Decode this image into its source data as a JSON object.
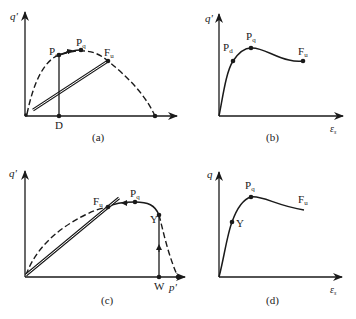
{
  "colors": {
    "ink": "#1a1a1a",
    "background": "#ffffff"
  },
  "panels": [
    {
      "id": "a",
      "caption": "(a)",
      "y_axis_label": "q'",
      "x_axis_label": "",
      "points": {
        "Pd": "P",
        "Pd_sub": "d",
        "Pq": "P",
        "Pq_sub": "q",
        "Fu": "F",
        "Fu_sub": "u",
        "D": "D"
      }
    },
    {
      "id": "b",
      "caption": "(b)",
      "y_axis_label": "q'",
      "x_axis_label": "ε",
      "x_axis_sub": "s",
      "points": {
        "Pd": "P",
        "Pd_sub": "d",
        "Pq": "P",
        "Pq_sub": "q",
        "Fu": "F",
        "Fu_sub": "u"
      }
    },
    {
      "id": "c",
      "caption": "(c)",
      "y_axis_label": "q'",
      "x_axis_label": "p'",
      "points": {
        "Fu": "F",
        "Fu_sub": "u",
        "Pq": "P",
        "Pq_sub": "q",
        "Y": "Y",
        "W": "W"
      }
    },
    {
      "id": "d",
      "caption": "(d)",
      "y_axis_label": "q",
      "x_axis_label": "ε",
      "x_axis_sub": "s",
      "points": {
        "Pq": "P",
        "Pq_sub": "q",
        "Fu": "F",
        "Fu_sub": "u",
        "Y": "Y"
      }
    }
  ]
}
